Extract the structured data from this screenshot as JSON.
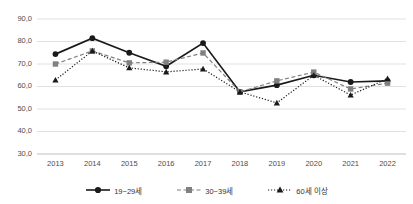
{
  "chart_data": {
    "type": "line",
    "title": "",
    "subtitle": "",
    "xlabel": "",
    "ylabel": "",
    "categories": [
      "2013",
      "2014",
      "2015",
      "2016",
      "2017",
      "2018",
      "2019",
      "2020",
      "2021",
      "2022"
    ],
    "ylim": [
      30.0,
      90.0
    ],
    "ytick_labels": [
      "90,0",
      "80,0",
      "70,0",
      "60,0",
      "50,0",
      "40,0",
      "30,0"
    ],
    "ytick_values": [
      90.0,
      80.0,
      70.0,
      60.0,
      50.0,
      40.0,
      30.0
    ],
    "grid": true,
    "legend_position": "bottom",
    "series": [
      {
        "name": "19~29세",
        "marker": "circle",
        "line_style": "solid",
        "color": "#1a1a1a",
        "values": [
          74.4,
          81.5,
          75.0,
          69.0,
          79.3,
          57.6,
          60.6,
          65.0,
          62.0,
          62.5
        ]
      },
      {
        "name": "30~39세",
        "marker": "square",
        "line_style": "dashed",
        "color": "#808080",
        "values": [
          70.0,
          75.8,
          70.5,
          70.8,
          74.9,
          57.6,
          62.5,
          66.4,
          58.9,
          61.5
        ]
      },
      {
        "name": "60세 이상",
        "marker": "triangle",
        "line_style": "dotted",
        "color": "#1a1a1a",
        "values": [
          62.9,
          75.8,
          68.3,
          66.5,
          67.8,
          57.6,
          52.7,
          65.0,
          56.2,
          63.5
        ]
      }
    ]
  },
  "legend": {
    "items": [
      {
        "label": "19~29세"
      },
      {
        "label": "30~39세"
      },
      {
        "label": "60세 이상"
      }
    ]
  }
}
